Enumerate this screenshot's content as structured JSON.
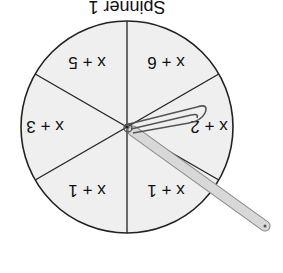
{
  "figure": {
    "orientation": "rotated 180 degrees",
    "caption": "Spinner 1",
    "sections": [
      {
        "label": "x + 1"
      },
      {
        "label": "x + 2"
      },
      {
        "label": "x + 3"
      },
      {
        "label": "x + 4"
      },
      {
        "label": "x + 5"
      },
      {
        "label": "x + 6"
      }
    ],
    "pointer": "paper clip and pencil",
    "colors": {
      "fill": "#efefef",
      "stroke": "#222222",
      "pencil": "#d0d0d0"
    }
  }
}
